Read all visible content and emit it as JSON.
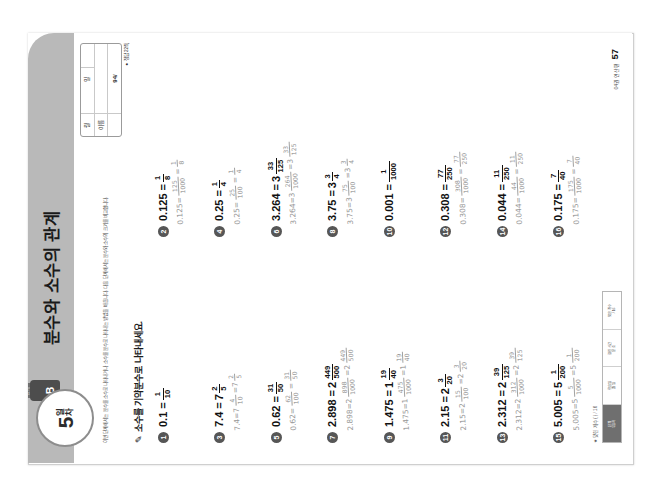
{
  "worksheet": {
    "day_badge": {
      "number": "5",
      "suffix_top": "일",
      "suffix_bottom": "차",
      "tab_label": "B",
      "tab_top_label": "단계"
    },
    "title": "분수와 소수의 관계",
    "mini_table": {
      "rows": [
        {
          "label": "월",
          "value": ""
        },
        {
          "label": "일",
          "value": ""
        },
        {
          "label": "이름",
          "value": ""
        }
      ],
      "score": "94/",
      "note": "● 정답 22쪽"
    },
    "intro": "이번 단계에서는 분수를 소수로 나타내거나 소수를 분수로 나타내는 방법을 배웁니다. 다음 단계에서는 분수와 소수의 크기를 비교합니다.",
    "instruction": "소수를 기약분수로 나타내세요.",
    "pen_icon": "✎",
    "footer_tag": "★ 맞힌 개수 (     ) / 16",
    "footer_strip": [
      {
        "top": "단계",
        "bottom": "5일차"
      },
      {
        "top": "학습일",
        "bottom": "월   일"
      },
      {
        "top": "걸린 시간",
        "bottom": "분   초"
      },
      {
        "top": "맞은 개수",
        "bottom": "/ 16"
      }
    ],
    "page_label": "04권 연산편",
    "page_number": "57",
    "problems": [
      {
        "n": "1",
        "decimal": "0.1",
        "whole": "",
        "num": "1",
        "den": "10",
        "work": ""
      },
      {
        "n": "2",
        "decimal": "0.125",
        "whole": "",
        "num": "1",
        "den": "8",
        "work": "0.125 = 125/1000 = 1/8"
      },
      {
        "n": "3",
        "decimal": "7.4",
        "whole": "7",
        "num": "2",
        "den": "5",
        "work": "7.4 = 7 4/10 = 7 2/5"
      },
      {
        "n": "4",
        "decimal": "0.25",
        "whole": "",
        "num": "1",
        "den": "4",
        "work": "0.25 = 25/100 = 1/4"
      },
      {
        "n": "5",
        "decimal": "0.62",
        "whole": "",
        "num": "31",
        "den": "50",
        "work": "0.62 = 62/100 = 31/50"
      },
      {
        "n": "6",
        "decimal": "3.264",
        "whole": "3",
        "num": "33",
        "den": "125",
        "work": "3.264 = 3 264/1000 = 3 33/125"
      },
      {
        "n": "7",
        "decimal": "2.898",
        "whole": "2",
        "num": "449",
        "den": "500",
        "work": "2.898 = 2 898/1000 = 2 449/500"
      },
      {
        "n": "8",
        "decimal": "3.75",
        "whole": "3",
        "num": "3",
        "den": "4",
        "work": "3.75 = 3 75/100 = 3 3/4"
      },
      {
        "n": "9",
        "decimal": "1.475",
        "whole": "1",
        "num": "19",
        "den": "40",
        "work": "1.475 = 1 475/1000 = 1 19/40"
      },
      {
        "n": "10",
        "decimal": "0.001",
        "whole": "",
        "num": "1",
        "den": "1000",
        "work": ""
      },
      {
        "n": "11",
        "decimal": "2.15",
        "whole": "2",
        "num": "3",
        "den": "20",
        "work": "2.15 = 2 15/100 = 2 3/20"
      },
      {
        "n": "12",
        "decimal": "0.308",
        "whole": "",
        "num": "77",
        "den": "250",
        "work": "0.308 = 308/1000 = 77/250"
      },
      {
        "n": "13",
        "decimal": "2.312",
        "whole": "2",
        "num": "39",
        "den": "125",
        "work": "2.312 = 2 312/1000 = 2 39/125"
      },
      {
        "n": "14",
        "decimal": "0.044",
        "whole": "",
        "num": "11",
        "den": "250",
        "work": "0.044 = 44/1000 = 11/250"
      },
      {
        "n": "15",
        "decimal": "5.005",
        "whole": "5",
        "num": "1",
        "den": "200",
        "work": "5.005 = 5 5/1000 = 5 1/200"
      },
      {
        "n": "16",
        "decimal": "0.175",
        "whole": "",
        "num": "7",
        "den": "40",
        "work": "0.175 = 175/1000 = 7/40"
      }
    ]
  }
}
